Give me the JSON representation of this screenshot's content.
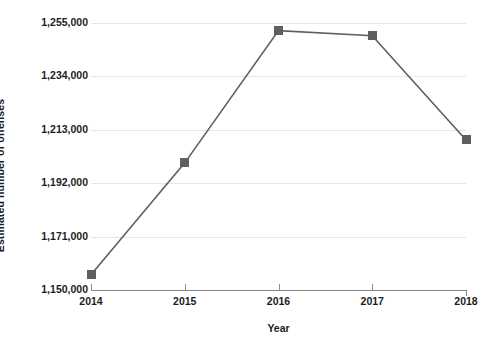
{
  "chart_data": {
    "type": "line",
    "title": "",
    "subtitle": "",
    "xlabel": "Year",
    "ylabel": "Estimated number of offenses",
    "categories": [
      "2014",
      "2015",
      "2016",
      "2017",
      "2018"
    ],
    "x": [
      2014,
      2015,
      2016,
      2017,
      2018
    ],
    "values": [
      1156000,
      1200000,
      1252000,
      1250000,
      1209000
    ],
    "series": [
      {
        "name": "Estimated number of offenses",
        "values": [
          1156000,
          1200000,
          1252000,
          1250000,
          1209000
        ]
      }
    ],
    "y_tick_labels": [
      "1,255,000",
      "1,234,000",
      "1,213,000",
      "1,192,000",
      "1,171,000",
      "1,150,000"
    ],
    "y_tick_values": [
      1255000,
      1234000,
      1213000,
      1192000,
      1171000,
      1150000
    ],
    "x_tick_labels": [
      "2014",
      "2015",
      "2016",
      "2017",
      "2018"
    ],
    "ylim": [
      1150000,
      1255000
    ],
    "xlim": [
      2014,
      2018
    ],
    "grid": "horizontal",
    "legend": "none",
    "marker": "square",
    "colors": {
      "line": "#5f5f5f",
      "marker": "#5f5f5f",
      "gridline": "#e6e6e6",
      "axis": "#8a8a8a",
      "text": "#1c1c1c",
      "background": "#ffffff"
    }
  },
  "axes": {
    "y_title": "Estimated number of offenses",
    "x_title": "Year",
    "y_ticks": [
      {
        "label": "1,255,000",
        "value": 1255000
      },
      {
        "label": "1,234,000",
        "value": 1234000
      },
      {
        "label": "1,213,000",
        "value": 1213000
      },
      {
        "label": "1,192,000",
        "value": 1192000
      },
      {
        "label": "1,171,000",
        "value": 1171000
      },
      {
        "label": "1,150,000",
        "value": 1150000
      }
    ],
    "x_ticks": [
      {
        "label": "2014",
        "value": 2014
      },
      {
        "label": "2015",
        "value": 2015
      },
      {
        "label": "2016",
        "value": 2016
      },
      {
        "label": "2017",
        "value": 2017
      },
      {
        "label": "2018",
        "value": 2018
      }
    ]
  }
}
